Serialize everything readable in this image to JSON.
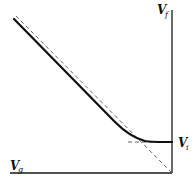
{
  "diagram": {
    "type": "asymptotic-curve",
    "labels": {
      "y_axis": {
        "main": "V",
        "sub": "f"
      },
      "x_axis": {
        "main": "V",
        "sub": "g"
      },
      "plateau": {
        "main": "V",
        "sub": "i"
      }
    },
    "colors": {
      "axis": "#1a1a1a",
      "curve": "#111111",
      "asymptote": "#555555",
      "background": "#ffffff"
    }
  }
}
